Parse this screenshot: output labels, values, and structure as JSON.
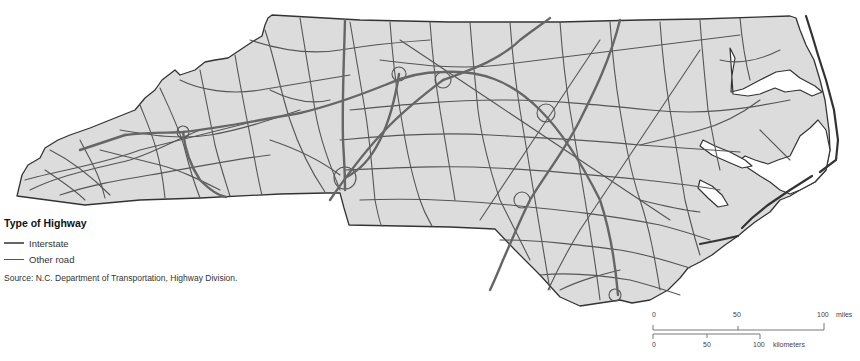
{
  "header": {
    "title_cropped": "Highway pattern figure (cut off at top)"
  },
  "legend": {
    "title": "Type of Highway",
    "items": [
      {
        "label": "Interstate",
        "style": "thick",
        "color": "#666666"
      },
      {
        "label": "Other road",
        "style": "thin",
        "color": "#555555"
      }
    ],
    "source": "Source: N.C. Department of Transportation, Highway Division."
  },
  "scale_bar": {
    "miles": {
      "ticks": [
        "0",
        "50",
        "100"
      ],
      "unit": "miles"
    },
    "kilometers": {
      "ticks": [
        "0",
        "50",
        "100"
      ],
      "unit": "kilometers"
    }
  },
  "map": {
    "region": "North Carolina",
    "land_color": "#dcdcdc",
    "water_color": "#ffffff",
    "outline_color": "#333333"
  }
}
